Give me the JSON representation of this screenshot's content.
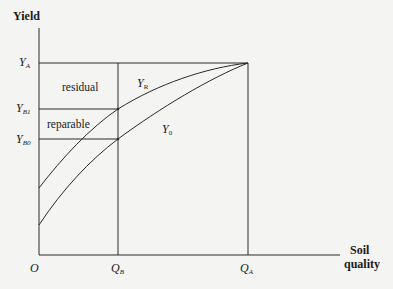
{
  "diagram": {
    "y_axis_title": "Yield",
    "x_axis_title_line1": "Soil",
    "x_axis_title_line2": "quality",
    "origin_label": "O",
    "y_ticks": [
      {
        "main": "Y",
        "sub": "A"
      },
      {
        "main": "Y",
        "sub": "B1"
      },
      {
        "main": "Y",
        "sub": "B0"
      }
    ],
    "x_ticks": [
      {
        "main": "Q",
        "sub": "B"
      },
      {
        "main": "Q",
        "sub": "A"
      }
    ],
    "regions": {
      "residual": "residual",
      "reparable": "reparable"
    },
    "curves": [
      {
        "main": "Y",
        "sub": "R"
      },
      {
        "main": "Y",
        "sub": "0"
      }
    ],
    "line_color": "#2a2a2a"
  }
}
